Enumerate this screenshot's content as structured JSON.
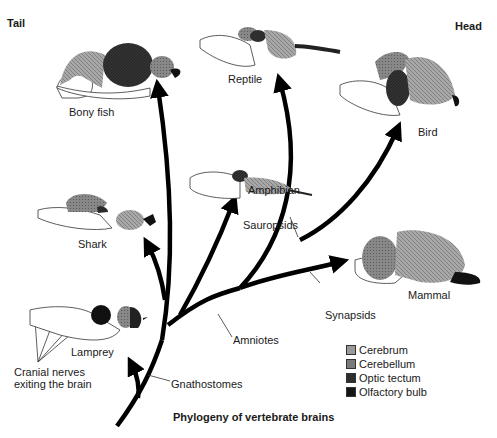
{
  "orientation": {
    "left_label": "Tail",
    "right_label": "Head"
  },
  "title": "Phylogeny of vertebrate brains",
  "species": [
    {
      "id": "lamprey",
      "label": "Lamprey"
    },
    {
      "id": "shark",
      "label": "Shark"
    },
    {
      "id": "bony_fish",
      "label": "Bony fish"
    },
    {
      "id": "amphibian",
      "label": "Amphibian"
    },
    {
      "id": "reptile",
      "label": "Reptile"
    },
    {
      "id": "bird",
      "label": "Bird"
    },
    {
      "id": "mammal",
      "label": "Mammal"
    }
  ],
  "clades": [
    {
      "id": "gnathostomes",
      "label": "Gnathostomes"
    },
    {
      "id": "amniotes",
      "label": "Amniotes"
    },
    {
      "id": "sauropsids",
      "label": "Sauropsids"
    },
    {
      "id": "synapsids",
      "label": "Synapsids"
    }
  ],
  "annotations": {
    "cranial_nerves_line1": "Cranial nerves",
    "cranial_nerves_line2": "exiting the brain"
  },
  "legend": [
    {
      "label": "Cerebrum",
      "color": "#9a9a9a"
    },
    {
      "label": "Cerebellum",
      "color": "#7a7a7a"
    },
    {
      "label": "Optic tectum",
      "color": "#2e2e2e"
    },
    {
      "label": "Olfactory bulb",
      "color": "#151515"
    }
  ],
  "colors": {
    "cerebrum": "#9a9a9a",
    "cerebellum": "#7a7a7a",
    "optic_tectum": "#2a2a2a",
    "olfactory_bulb": "#111111",
    "branch": "#000000"
  }
}
